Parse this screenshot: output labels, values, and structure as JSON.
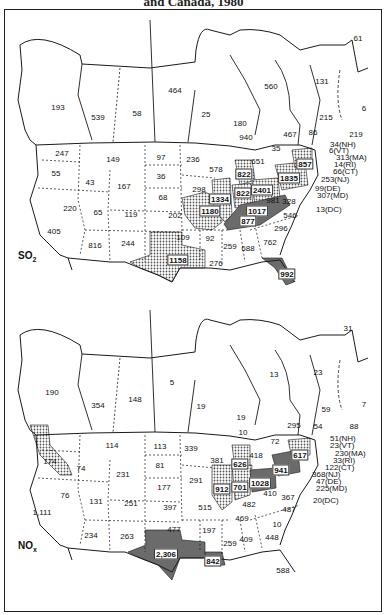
{
  "title": "and Canada, 1980",
  "panels": [
    {
      "pollutant": "SO",
      "pollutant_sub": "2",
      "canada": [
        {
          "region": "British Columbia",
          "value": "193",
          "x": 58,
          "y": 107
        },
        {
          "region": "Alberta",
          "value": "539",
          "x": 98,
          "y": 117
        },
        {
          "region": "Saskatchewan",
          "value": "58",
          "x": 137,
          "y": 113
        },
        {
          "region": "Manitoba",
          "value": "464",
          "x": 175,
          "y": 90
        },
        {
          "region": "NW Ontario",
          "value": "25",
          "x": 206,
          "y": 114
        },
        {
          "region": "Ontario",
          "value": "180",
          "x": 240,
          "y": 123
        },
        {
          "region": "Ontario (Sudbury)",
          "value": "940",
          "x": 246,
          "y": 137
        },
        {
          "region": "Quebec",
          "value": "560",
          "x": 271,
          "y": 86
        },
        {
          "region": "Southern Quebec",
          "value": "467",
          "x": 290,
          "y": 134
        },
        {
          "region": "Newfoundland-Labrador",
          "value": "131",
          "x": 322,
          "y": 81
        },
        {
          "region": "Newfoundland",
          "value": "61",
          "x": 358,
          "y": 38
        },
        {
          "region": "Prince Edward Island",
          "value": "6",
          "x": 364,
          "y": 108
        },
        {
          "region": "Nova Scotia",
          "value": "215",
          "x": 326,
          "y": 117
        },
        {
          "region": "New Brunswick",
          "value": "86",
          "x": 313,
          "y": 132
        },
        {
          "region": "Cape Breton",
          "value": "219",
          "x": 356,
          "y": 134
        }
      ],
      "us": [
        {
          "state": "WA",
          "value": "247",
          "x": 62,
          "y": 153
        },
        {
          "state": "OR",
          "value": "55",
          "x": 56,
          "y": 173
        },
        {
          "state": "ID",
          "value": "43",
          "x": 90,
          "y": 182
        },
        {
          "state": "MT",
          "value": "149",
          "x": 113,
          "y": 159
        },
        {
          "state": "WY",
          "value": "167",
          "x": 124,
          "y": 186
        },
        {
          "state": "ND",
          "value": "97",
          "x": 161,
          "y": 157
        },
        {
          "state": "SD",
          "value": "36",
          "x": 161,
          "y": 176
        },
        {
          "state": "NE",
          "value": "68",
          "x": 163,
          "y": 197
        },
        {
          "state": "KS",
          "value": "202",
          "x": 175,
          "y": 215
        },
        {
          "state": "MN",
          "value": "236",
          "x": 193,
          "y": 159
        },
        {
          "state": "IA",
          "value": "298",
          "x": 199,
          "y": 189
        },
        {
          "state": "MO",
          "value": "1180",
          "x": 210,
          "y": 211
        },
        {
          "state": "WI",
          "value": "578",
          "x": 216,
          "y": 169
        },
        {
          "state": "IL",
          "value": "1334",
          "x": 220,
          "y": 199
        },
        {
          "state": "MI",
          "value": "822",
          "x": 244,
          "y": 174
        },
        {
          "state": "IN",
          "value": "822",
          "x": 243,
          "y": 193
        },
        {
          "state": "OH",
          "value": "2401",
          "x": 262,
          "y": 190
        },
        {
          "state": "KY",
          "value": "1017",
          "x": 257,
          "y": 211
        },
        {
          "state": "TN",
          "value": "877",
          "x": 248,
          "y": 221
        },
        {
          "state": "WV",
          "value": "981",
          "x": 273,
          "y": 200
        },
        {
          "state": "PA",
          "value": "1835",
          "x": 289,
          "y": 178
        },
        {
          "state": "NY",
          "value": "857",
          "x": 305,
          "y": 164
        },
        {
          "state": "VA",
          "value": "328",
          "x": 289,
          "y": 201
        },
        {
          "state": "NC",
          "value": "546",
          "x": 290,
          "y": 215
        },
        {
          "state": "SC",
          "value": "296",
          "x": 281,
          "y": 228
        },
        {
          "state": "GA",
          "value": "762",
          "x": 270,
          "y": 242
        },
        {
          "state": "AL",
          "value": "688",
          "x": 248,
          "y": 248
        },
        {
          "state": "MS",
          "value": "259",
          "x": 230,
          "y": 246
        },
        {
          "state": "LA",
          "value": "276",
          "x": 216,
          "y": 263
        },
        {
          "state": "AR",
          "value": "92",
          "x": 210,
          "y": 238
        },
        {
          "state": "OK",
          "value": "109",
          "x": 183,
          "y": 237
        },
        {
          "state": "TX",
          "value": "1158",
          "x": 178,
          "y": 260
        },
        {
          "state": "FL",
          "value": "992",
          "x": 287,
          "y": 274
        },
        {
          "state": "CA",
          "value": "405",
          "x": 54,
          "y": 231
        },
        {
          "state": "NV",
          "value": "220",
          "x": 70,
          "y": 208
        },
        {
          "state": "UT",
          "value": "65",
          "x": 98,
          "y": 212
        },
        {
          "state": "CO",
          "value": "119",
          "x": 131,
          "y": 214
        },
        {
          "state": "AZ",
          "value": "816",
          "x": 95,
          "y": 245
        },
        {
          "state": "NM",
          "value": "244",
          "x": 128,
          "y": 243
        },
        {
          "state": "ME",
          "value": "35",
          "x": 276,
          "y": 148
        },
        {
          "state": "VT-area",
          "value": "651",
          "x": 258,
          "y": 161
        }
      ],
      "ne_callouts": [
        {
          "label": "34(NH)",
          "x": 330,
          "y": 144
        },
        {
          "label": "6(VT)",
          "x": 329,
          "y": 150
        },
        {
          "label": "313(MA)",
          "x": 336,
          "y": 157
        },
        {
          "label": "14(RI)",
          "x": 334,
          "y": 164
        },
        {
          "label": "66(CT)",
          "x": 333,
          "y": 171
        },
        {
          "label": "253(NJ)",
          "x": 321,
          "y": 179
        },
        {
          "label": "99(DE)",
          "x": 315,
          "y": 188
        },
        {
          "label": "307(MD)",
          "x": 317,
          "y": 195
        },
        {
          "label": "13(DC)",
          "x": 316,
          "y": 209
        }
      ]
    },
    {
      "pollutant": "NO",
      "pollutant_sub": "x",
      "canada": [
        {
          "region": "British Columbia",
          "value": "190",
          "x": 52,
          "y": 392
        },
        {
          "region": "Alberta",
          "value": "354",
          "x": 98,
          "y": 405
        },
        {
          "region": "Saskatchewan",
          "value": "148",
          "x": 135,
          "y": 399
        },
        {
          "region": "Manitoba",
          "value": "5",
          "x": 172,
          "y": 382
        },
        {
          "region": "NW Ontario",
          "value": "19",
          "x": 201,
          "y": 406
        },
        {
          "region": "Ontario",
          "value": "19",
          "x": 241,
          "y": 417
        },
        {
          "region": "Ontario (Sudbury)",
          "value": "10",
          "x": 243,
          "y": 432
        },
        {
          "region": "Quebec",
          "value": "13",
          "x": 274,
          "y": 374
        },
        {
          "region": "Southern Quebec",
          "value": "295",
          "x": 294,
          "y": 425
        },
        {
          "region": "Newfoundland-Labrador",
          "value": "23",
          "x": 318,
          "y": 372
        },
        {
          "region": "Newfoundland",
          "value": "31",
          "x": 348,
          "y": 328
        },
        {
          "region": "Prince Edward Island",
          "value": "7",
          "x": 364,
          "y": 404
        },
        {
          "region": "Nova Scotia",
          "value": "59",
          "x": 326,
          "y": 409
        },
        {
          "region": "New Brunswick",
          "value": "54",
          "x": 318,
          "y": 426
        },
        {
          "region": "Cape Breton",
          "value": "88",
          "x": 354,
          "y": 426
        }
      ],
      "us": [
        {
          "state": "WA",
          "value": "174",
          "x": 50,
          "y": 461
        },
        {
          "state": "OR",
          "value": "74",
          "x": 81,
          "y": 468
        },
        {
          "state": "ID",
          "value": "231",
          "x": 123,
          "y": 474
        },
        {
          "state": "MT",
          "value": "114",
          "x": 112,
          "y": 445
        },
        {
          "state": "ND",
          "value": "113",
          "x": 160,
          "y": 446
        },
        {
          "state": "SD",
          "value": "81",
          "x": 160,
          "y": 465
        },
        {
          "state": "NE",
          "value": "177",
          "x": 164,
          "y": 487
        },
        {
          "state": "KS",
          "value": "397",
          "x": 170,
          "y": 507
        },
        {
          "state": "MN",
          "value": "339",
          "x": 191,
          "y": 448
        },
        {
          "state": "WI",
          "value": "381",
          "x": 217,
          "y": 460
        },
        {
          "state": "IA",
          "value": "291",
          "x": 196,
          "y": 480
        },
        {
          "state": "MO",
          "value": "515",
          "x": 205,
          "y": 507
        },
        {
          "state": "OK",
          "value": "477",
          "x": 174,
          "y": 529
        },
        {
          "state": "AR",
          "value": "197",
          "x": 209,
          "y": 530
        },
        {
          "state": "TX",
          "value": "2,306",
          "x": 166,
          "y": 554
        },
        {
          "state": "LA",
          "value": "842",
          "x": 213,
          "y": 561
        },
        {
          "state": "IL",
          "value": "912",
          "x": 222,
          "y": 489
        },
        {
          "state": "IN",
          "value": "701",
          "x": 240,
          "y": 487
        },
        {
          "state": "MI",
          "value": "626",
          "x": 240,
          "y": 464
        },
        {
          "state": "OH",
          "value": "1028",
          "x": 260,
          "y": 483
        },
        {
          "state": "PA",
          "value": "941",
          "x": 281,
          "y": 470
        },
        {
          "state": "NY",
          "value": "617",
          "x": 300,
          "y": 455
        },
        {
          "state": "WV",
          "value": "410",
          "x": 270,
          "y": 493
        },
        {
          "state": "VA",
          "value": "367",
          "x": 288,
          "y": 497
        },
        {
          "state": "KY",
          "value": "482",
          "x": 249,
          "y": 504
        },
        {
          "state": "TN",
          "value": "469",
          "x": 242,
          "y": 518
        },
        {
          "state": "NC",
          "value": "487",
          "x": 289,
          "y": 509
        },
        {
          "state": "SC",
          "value": "10",
          "x": 277,
          "y": 524
        },
        {
          "state": "GA",
          "value": "448",
          "x": 272,
          "y": 537
        },
        {
          "state": "AL",
          "value": "409",
          "x": 246,
          "y": 539
        },
        {
          "state": "MS",
          "value": "259",
          "x": 230,
          "y": 543
        },
        {
          "state": "FL",
          "value": "588",
          "x": 283,
          "y": 570
        },
        {
          "state": "CA",
          "value": "1,111",
          "x": 42,
          "y": 512
        },
        {
          "state": "NV",
          "value": "76",
          "x": 65,
          "y": 495
        },
        {
          "state": "UT",
          "value": "131",
          "x": 96,
          "y": 501
        },
        {
          "state": "CO",
          "value": "251",
          "x": 131,
          "y": 503
        },
        {
          "state": "AZ",
          "value": "234",
          "x": 91,
          "y": 535
        },
        {
          "state": "NM",
          "value": "263",
          "x": 127,
          "y": 536
        },
        {
          "state": "ME",
          "value": "72",
          "x": 275,
          "y": 441
        },
        {
          "state": "VT-area",
          "value": "418",
          "x": 256,
          "y": 455
        }
      ],
      "ne_callouts": [
        {
          "label": "51(NH)",
          "x": 330,
          "y": 438
        },
        {
          "label": "23(VT)",
          "x": 330,
          "y": 445
        },
        {
          "label": "230(MA)",
          "x": 335,
          "y": 453
        },
        {
          "label": "33(RI)",
          "x": 333,
          "y": 460
        },
        {
          "label": "122(CT)",
          "x": 325,
          "y": 467
        },
        {
          "label": "368(NJ)",
          "x": 312,
          "y": 474
        },
        {
          "label": "47(DE)",
          "x": 316,
          "y": 481
        },
        {
          "label": "225(MD)",
          "x": 316,
          "y": 488
        },
        {
          "label": "20(DC)",
          "x": 313,
          "y": 500
        }
      ]
    }
  ],
  "shading": {
    "light_dot_fill": "#bdbdbd",
    "heavy_fill": "#6e6e6e",
    "line_color": "#1a1a1a"
  }
}
